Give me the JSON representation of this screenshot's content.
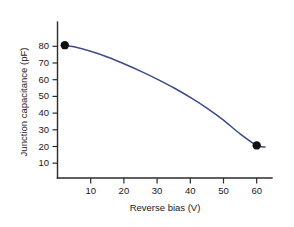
{
  "chart_data": {
    "type": "line",
    "title": "",
    "xlabel": "Reverse bias (V)",
    "ylabel": "Junction capacitance (pF)",
    "xlim": [
      0,
      64
    ],
    "ylim": [
      0,
      88
    ],
    "xticks": [
      10,
      20,
      30,
      40,
      50,
      60
    ],
    "yticks": [
      10,
      20,
      30,
      40,
      50,
      60,
      70,
      80
    ],
    "xtick_labels": [
      "10",
      "20",
      "30",
      "40",
      "50",
      "60"
    ],
    "ytick_labels": [
      "10",
      "20",
      "30",
      "40",
      "50",
      "60",
      "70",
      "80"
    ],
    "grid": false,
    "legend": null,
    "series": [
      {
        "name": "Junction capacitance vs reverse bias",
        "color": "#3c4a87",
        "x": [
          2.2,
          5,
          10,
          15,
          20,
          25,
          30,
          35,
          40,
          45,
          50,
          55,
          60,
          62.5
        ],
        "y": [
          79.5,
          78.5,
          75.8,
          72.4,
          68.4,
          64.0,
          59.2,
          54.0,
          48.2,
          41.8,
          34.6,
          26.4,
          19.5,
          18.6
        ]
      }
    ],
    "markers": [
      {
        "label": "left-endpoint",
        "x": 2.2,
        "y": 79.5,
        "color": "#111111"
      },
      {
        "label": "right-endpoint",
        "x": 60,
        "y": 19.5,
        "color": "#111111"
      }
    ],
    "plot_area": {
      "x_axis_pixel_origin": 57.5,
      "y_axis_pixel_baseline": 178,
      "px_per_volt": 3.32,
      "px_per_pF": 1.671
    }
  },
  "figure": {
    "background_color": "#ffffff",
    "axis_color": "#2b2b2b",
    "curve_color": "#3c4a87",
    "marker_color": "#111111"
  }
}
